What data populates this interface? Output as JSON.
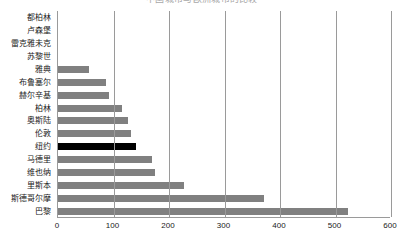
{
  "chart_data": {
    "type": "bar",
    "orientation": "horizontal",
    "title": "中国城市与欧洲城市的比较",
    "xlabel": "",
    "ylabel": "",
    "xlim": [
      0,
      600
    ],
    "xticks": [
      0,
      100,
      200,
      300,
      400,
      500,
      600
    ],
    "xtick_labels": [
      "0",
      "100",
      "200",
      "300",
      "400",
      "500",
      "600"
    ],
    "grid": true,
    "grid_axis": "x",
    "legend": false,
    "categories": [
      "都柏林",
      "卢森堡",
      "雷克雅未克",
      "苏黎世",
      "雅典",
      "布鲁塞尔",
      "赫尔辛基",
      "柏林",
      "奥斯陆",
      "伦敦",
      "纽约",
      "马德里",
      "维也纳",
      "里斯本",
      "斯德哥尔摩",
      "巴黎"
    ],
    "values": [
      0,
      0,
      0,
      0,
      55,
      86,
      91,
      115,
      127,
      131,
      140,
      169,
      174,
      227,
      372,
      522
    ],
    "bar_color": "#808080",
    "highlight_color": "#000000",
    "highlight_category": "纽约"
  }
}
